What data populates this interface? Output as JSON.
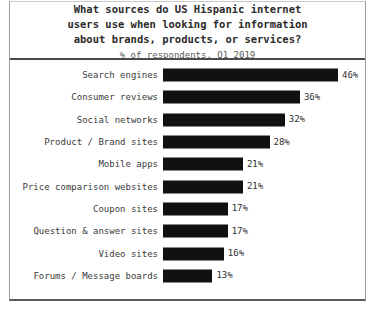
{
  "chart_data": {
    "type": "bar",
    "orientation": "horizontal",
    "title": "What sources do US Hispanic internet users use when looking for information about brands, products, or services?",
    "title_lines": [
      "What sources do US Hispanic internet",
      "users use when looking for information",
      "about brands, products, or services?"
    ],
    "subtitle": "% of respondents, Q1 2019",
    "xlabel": "",
    "ylabel": "",
    "xlim": [
      0,
      50
    ],
    "grid": false,
    "legend": "none",
    "bar_color": "#111111",
    "categories": [
      "Search engines",
      "Consumer reviews",
      "Social networks",
      "Product / Brand sites",
      "Mobile apps",
      "Price comparison websites",
      "Coupon sites",
      "Question & answer sites",
      "Video sites",
      "Forums / Message boards"
    ],
    "values": [
      46,
      36,
      32,
      28,
      21,
      21,
      17,
      17,
      16,
      13
    ],
    "value_labels": [
      "46%",
      "36%",
      "32%",
      "28%",
      "21%",
      "21%",
      "17%",
      "17%",
      "16%",
      "13%"
    ]
  }
}
